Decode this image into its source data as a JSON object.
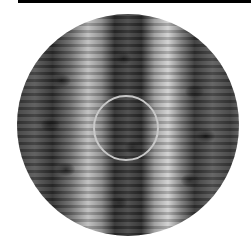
{
  "image": {
    "subject": "close-up of knitted cable texture, grayscale, circular crop",
    "highlight": "light gray circle marking center region"
  },
  "colors": {
    "top_bar": "#000000",
    "ring": "#c8c8c8"
  }
}
